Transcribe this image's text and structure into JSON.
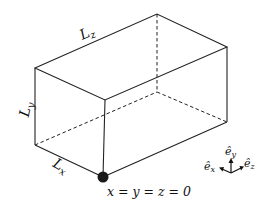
{
  "diagram": {
    "type": "3d-box-domain",
    "labels": {
      "lz": "L",
      "lz_sub": "z",
      "ly": "L",
      "ly_sub": "y",
      "lx": "L",
      "lx_sub": "x",
      "origin": "x = y = z = 0"
    },
    "axes": {
      "ex": "ê",
      "ex_sub": "x",
      "ey": "ê",
      "ey_sub": "y",
      "ez": "ê",
      "ez_sub": "z"
    },
    "colors": {
      "line": "#222222",
      "origin_dot": "#1a1a1a"
    }
  }
}
